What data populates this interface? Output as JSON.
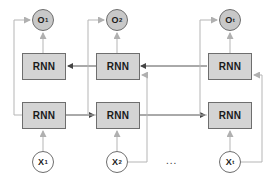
{
  "diagram": {
    "colors": {
      "box_fill": "#d4d4d4",
      "box_border": "#6e6e6e",
      "output_node_fill": "#c8c8c8",
      "input_node_fill": "#ffffff",
      "line_dark": "#555555",
      "line_light": "#b5b5b5"
    },
    "columns": [
      {
        "output": {
          "main": "O",
          "sub": "1"
        },
        "backward_cell": "RNN",
        "forward_cell": "RNN",
        "input": {
          "main": "X",
          "sub": "1"
        }
      },
      {
        "output": {
          "main": "O",
          "sub": "2"
        },
        "backward_cell": "RNN",
        "forward_cell": "RNN",
        "input": {
          "main": "X",
          "sub": "2"
        }
      },
      {
        "output": {
          "main": "O",
          "sub": "t"
        },
        "backward_cell": "RNN",
        "forward_cell": "RNN",
        "input": {
          "main": "X",
          "sub": "t"
        }
      }
    ],
    "ellipsis": "..."
  }
}
